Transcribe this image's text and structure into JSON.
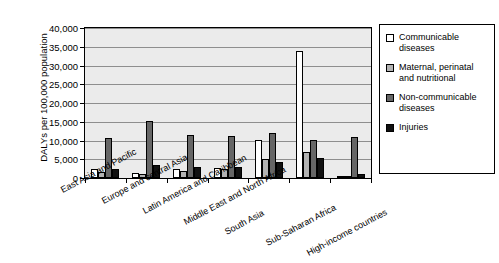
{
  "chart_data": {
    "type": "bar",
    "title": "",
    "xlabel": "",
    "ylabel": "DALYs per 100,000 population",
    "ylim": [
      0,
      40000
    ],
    "ytick_values": [
      0,
      5000,
      10000,
      15000,
      20000,
      25000,
      30000,
      35000,
      40000
    ],
    "ytick_labels": [
      "0",
      "5,000",
      "10,000",
      "15,000",
      "20,000",
      "25,000",
      "30,000",
      "35,000",
      "40,000"
    ],
    "grid": true,
    "legend_position": "right",
    "categories": [
      "East Asia and Pacific",
      "Europe and central Asia",
      "Latin America and Caribbean",
      "Middle East and North Africa",
      "South Asia",
      "Sub-Saharan Africa",
      "High-income countries"
    ],
    "series": [
      {
        "name": "Communicable diseases",
        "color": "#ffffff",
        "values": [
          2400,
          1400,
          2500,
          2700,
          10200,
          34000,
          300
        ]
      },
      {
        "name": "Maternal, perinatal and nutritional",
        "color": "#b3b3b3",
        "values": [
          1500,
          950,
          2000,
          2500,
          5200,
          6900,
          150
        ]
      },
      {
        "name": "Non-communicable diseases",
        "color": "#666666",
        "values": [
          10600,
          15100,
          11400,
          11100,
          12100,
          10100,
          11000
        ]
      },
      {
        "name": "Injuries",
        "color": "#111111",
        "values": [
          2300,
          3500,
          2900,
          2900,
          4400,
          5300,
          1200
        ]
      }
    ]
  },
  "legend": {
    "items": [
      {
        "label": "Communicable diseases"
      },
      {
        "label": "Maternal, perinatal and nutritional"
      },
      {
        "label": "Non-communicable diseases"
      },
      {
        "label": "Injuries"
      }
    ]
  }
}
